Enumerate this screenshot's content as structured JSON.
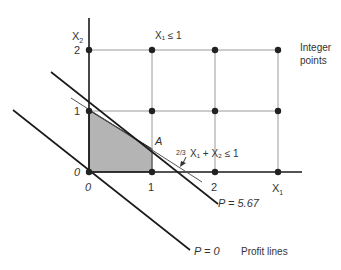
{
  "figure": {
    "title_partial": "FIGURE 3"
  },
  "axes": {
    "x_label": "X",
    "x_sub": "1",
    "y_label": "X",
    "y_sub": "2",
    "origin_label_x": "0",
    "origin_label_y": "0",
    "x_ticks": [
      "1",
      "2"
    ],
    "y_ticks": [
      "1",
      "2"
    ]
  },
  "labels": {
    "constraint_x1": "X₁ ≤ 1",
    "constraint_main_frac": "2/3",
    "constraint_main": "X₁ + X₂ ≤ 1",
    "point_a": "A",
    "profit_high": "P = 5.67",
    "profit_zero": "P = 0",
    "profit_lines": "Profit lines",
    "integer_points_line1": "Integer",
    "integer_points_line2": "points"
  },
  "colors": {
    "axis": "#1a1a1a",
    "grid": "#9a9a9a",
    "feasible_fill": "#b4b4b4",
    "point": "#222222",
    "text": "#333333"
  },
  "integer_points": [
    {
      "x": 0,
      "y": 0
    },
    {
      "x": 1,
      "y": 0
    },
    {
      "x": 2,
      "y": 0
    },
    {
      "x": 3,
      "y": 0
    },
    {
      "x": 0,
      "y": 1
    },
    {
      "x": 1,
      "y": 1
    },
    {
      "x": 2,
      "y": 1
    },
    {
      "x": 3,
      "y": 1
    },
    {
      "x": 0,
      "y": 2
    },
    {
      "x": 1,
      "y": 2
    },
    {
      "x": 2,
      "y": 2
    },
    {
      "x": 3,
      "y": 2
    }
  ]
}
